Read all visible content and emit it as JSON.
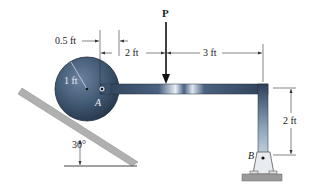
{
  "diagram": {
    "type": "statics-free-body-problem",
    "labels": {
      "load": "P",
      "pin_a": "A",
      "pin_b": "B",
      "wheel_radius": "1 ft",
      "offset": "0.5 ft",
      "dist_a_to_load": "2 ft",
      "dist_load_to_corner": "3 ft",
      "vertical_height": "2 ft",
      "incline_angle": "30°"
    },
    "colors": {
      "wheel": "#3f5670",
      "bar": "#4a6280",
      "incline": "#a8a8a8",
      "ground": "#9a9a9a",
      "dim_line": "#333333",
      "background": "#ffffff"
    }
  }
}
